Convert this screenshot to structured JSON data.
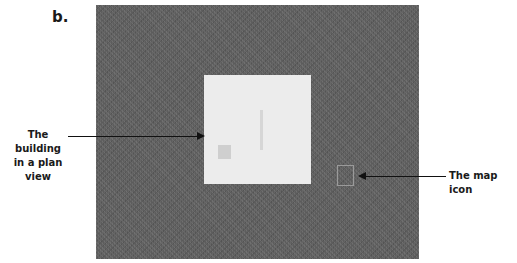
{
  "panel_label": "b.",
  "callouts": {
    "building": {
      "line1": "The building",
      "line2": "in a plan view"
    },
    "map_icon": "The map icon"
  },
  "colors": {
    "ground": "#5d5d5d",
    "building": "#ececec",
    "map_icon_outline": "#9a9a9a"
  }
}
